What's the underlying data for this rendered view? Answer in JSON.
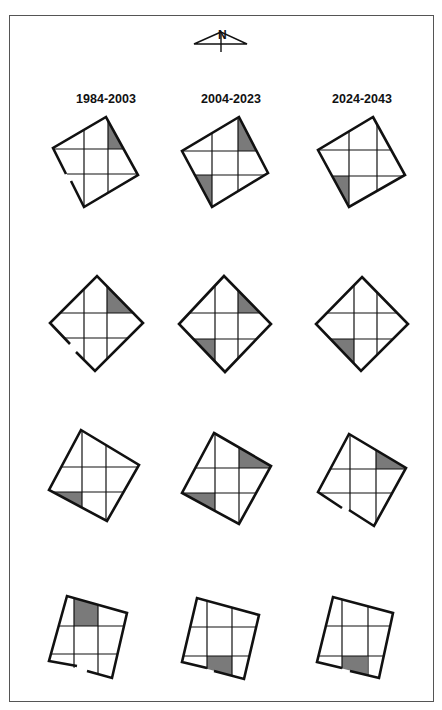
{
  "north_arrow": {
    "label": "N"
  },
  "columns": [
    {
      "label": "1984-2003"
    },
    {
      "label": "2004-2023"
    },
    {
      "label": "2024-2043"
    }
  ],
  "colors": {
    "line": "#111111",
    "shade": "#7a7a7a",
    "frame": "#555555"
  },
  "diagrams": [
    {
      "row": 1,
      "col": 1,
      "shaded_cells": [
        "top-right"
      ],
      "door": "lower-left"
    },
    {
      "row": 1,
      "col": 2,
      "shaded_cells": [
        "top-right",
        "bottom-left"
      ],
      "door": "none"
    },
    {
      "row": 1,
      "col": 3,
      "shaded_cells": [
        "bottom-left"
      ],
      "door": "none"
    },
    {
      "row": 2,
      "col": 1,
      "shaded_cells": [
        "top-right"
      ],
      "door": "lower-left"
    },
    {
      "row": 2,
      "col": 2,
      "shaded_cells": [
        "top-right",
        "bottom-left"
      ],
      "door": "none"
    },
    {
      "row": 2,
      "col": 3,
      "shaded_cells": [
        "bottom-left"
      ],
      "door": "none"
    },
    {
      "row": 3,
      "col": 1,
      "shaded_cells": [
        "bottom-left"
      ],
      "door": "none"
    },
    {
      "row": 3,
      "col": 2,
      "shaded_cells": [
        "top-right",
        "bottom-left"
      ],
      "door": "none"
    },
    {
      "row": 3,
      "col": 3,
      "shaded_cells": [
        "top-right"
      ],
      "door": "lower-left"
    },
    {
      "row": 4,
      "col": 1,
      "shaded_cells": [
        "top-center"
      ],
      "door": "bottom"
    },
    {
      "row": 4,
      "col": 2,
      "shaded_cells": [
        "bottom-center"
      ],
      "door": "bottom-left"
    },
    {
      "row": 4,
      "col": 3,
      "shaded_cells": [
        "bottom-center"
      ],
      "door": "bottom-left"
    }
  ]
}
